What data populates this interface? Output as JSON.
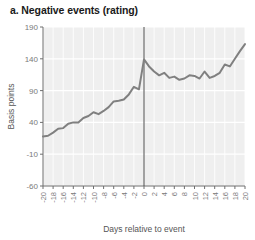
{
  "chart_data": {
    "type": "line",
    "title": "a. Negative events (rating)",
    "xlabel": "Days relative to event",
    "ylabel": "Basis points",
    "xlim": [
      -20,
      20
    ],
    "ylim": [
      -60,
      190
    ],
    "yticks": [
      190,
      140,
      90,
      40,
      -10,
      -60
    ],
    "ytick_labels": [
      "190",
      "140",
      "90",
      "40",
      "-10",
      "-60"
    ],
    "xticks": [
      -20,
      -18,
      -16,
      -14,
      -12,
      -10,
      -8,
      -6,
      -4,
      -2,
      0,
      2,
      4,
      6,
      8,
      10,
      12,
      14,
      16,
      18,
      20
    ],
    "xtick_labels": [
      "-20",
      "-18",
      "-16",
      "-14",
      "-12",
      "-10",
      "-8",
      "-6",
      "-4",
      "-2",
      "0",
      "2",
      "4",
      "6",
      "8",
      "10",
      "12",
      "14",
      "16",
      "18",
      "20"
    ],
    "grid": true,
    "legend": "none",
    "event_line_x": 0,
    "line_color": "#808080",
    "plot_background": "#efefef",
    "gridline_color": "#ffffff",
    "series": [
      {
        "name": "Negative events (rating)",
        "x": [
          -20,
          -19,
          -18,
          -17,
          -16,
          -15,
          -14,
          -13,
          -12,
          -11,
          -10,
          -9,
          -8,
          -7,
          -6,
          -5,
          -4,
          -3,
          -2,
          -1,
          0,
          1,
          2,
          3,
          4,
          5,
          6,
          7,
          8,
          9,
          10,
          11,
          12,
          13,
          14,
          15,
          16,
          17,
          18,
          19,
          20
        ],
        "values": [
          18,
          19,
          24,
          30,
          31,
          38,
          40,
          40,
          47,
          50,
          56,
          53,
          58,
          64,
          73,
          74,
          76,
          84,
          96,
          92,
          139,
          128,
          120,
          114,
          118,
          110,
          112,
          107,
          109,
          114,
          113,
          109,
          120,
          110,
          113,
          118,
          131,
          128,
          140,
          152,
          163
        ]
      }
    ]
  }
}
